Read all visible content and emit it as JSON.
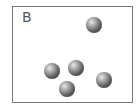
{
  "panel": {
    "label": "B",
    "border_color": "#7a7a7a",
    "background": "#ffffff"
  },
  "particles": [
    {
      "id": 1,
      "cx": 94,
      "cy": 25,
      "r": 8
    },
    {
      "id": 2,
      "cx": 52,
      "cy": 71,
      "r": 8
    },
    {
      "id": 3,
      "cx": 76,
      "cy": 68,
      "r": 8
    },
    {
      "id": 4,
      "cx": 67,
      "cy": 89,
      "r": 8
    },
    {
      "id": 5,
      "cx": 104,
      "cy": 80,
      "r": 8
    }
  ],
  "particle_count": 5,
  "particle_style": "gray shaded sphere"
}
